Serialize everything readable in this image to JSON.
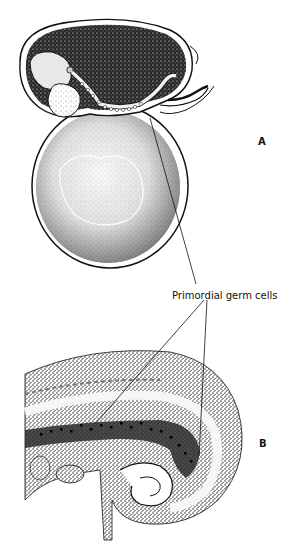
{
  "figure": {
    "panels": [
      {
        "id": "A",
        "label": "A"
      },
      {
        "id": "B",
        "label": "B"
      }
    ],
    "callout": {
      "text": "Primordial germ cells"
    },
    "colors": {
      "ink": "#111111",
      "paper": "#ffffff"
    }
  }
}
